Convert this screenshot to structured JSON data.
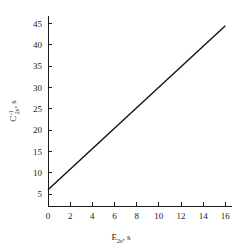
{
  "chart_data": {
    "type": "line",
    "title": "",
    "xlabel": "E2s, s",
    "xlabel_base": "E",
    "xlabel_sub": "2s",
    "xlabel_unit": ", s",
    "ylabel": "C-1 2s, s",
    "ylabel_base": "C",
    "ylabel_sub": "2s",
    "ylabel_sup": "-1",
    "ylabel_unit": ", s",
    "xlim": [
      0,
      16.6
    ],
    "ylim": [
      2.2,
      46.8
    ],
    "xticks": [
      0,
      2,
      4,
      6,
      8,
      10,
      12,
      14,
      16
    ],
    "yticks": [
      5,
      10,
      15,
      20,
      25,
      30,
      35,
      40,
      45
    ],
    "xtick_labels": [
      "0",
      "2",
      "4",
      "6",
      "8",
      "10",
      "12",
      "14",
      "16"
    ],
    "ytick_labels": [
      "5",
      "10",
      "15",
      "20",
      "25",
      "30",
      "35",
      "40",
      "45"
    ],
    "grid": false,
    "legend": false,
    "series": [
      {
        "name": "linear fit",
        "x": [
          0,
          16
        ],
        "values": [
          6.0,
          44.5
        ]
      }
    ],
    "line_color": "#111111"
  }
}
